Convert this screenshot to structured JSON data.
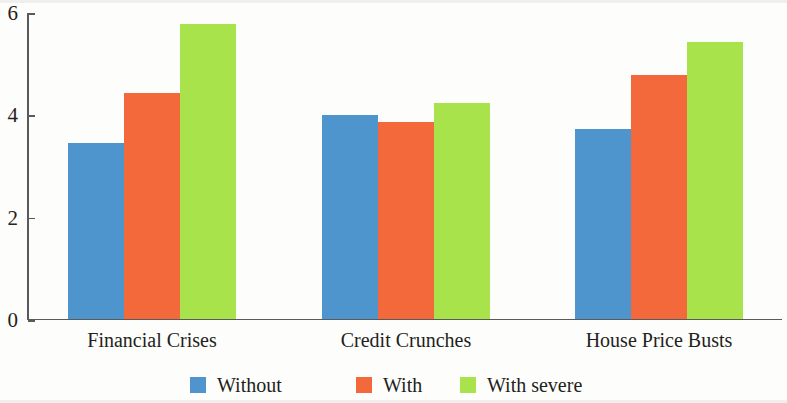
{
  "chart_data": {
    "type": "bar",
    "title": "",
    "subtitle": "",
    "xlabel": "",
    "ylabel": "",
    "categories": [
      "Financial Crises",
      "Credit Crunches",
      "House Price Busts"
    ],
    "series": [
      {
        "name": "Without",
        "color": "#4f95cd",
        "values": [
          3.43,
          3.98,
          3.71
        ]
      },
      {
        "name": "With",
        "color": "#f4693c",
        "values": [
          4.4,
          3.85,
          4.76
        ]
      },
      {
        "name": "With severe",
        "color": "#a9e34b",
        "values": [
          5.75,
          4.21,
          5.4
        ]
      }
    ],
    "ylim": [
      0,
      6
    ],
    "yticks": [
      0,
      2,
      4,
      6
    ],
    "ytick_labels": [
      "0",
      "2",
      "4",
      "6"
    ],
    "grid": false,
    "legend_position": "bottom"
  },
  "legend": {
    "items": [
      {
        "label": "Without"
      },
      {
        "label": "With"
      },
      {
        "label": "With severe"
      }
    ]
  }
}
